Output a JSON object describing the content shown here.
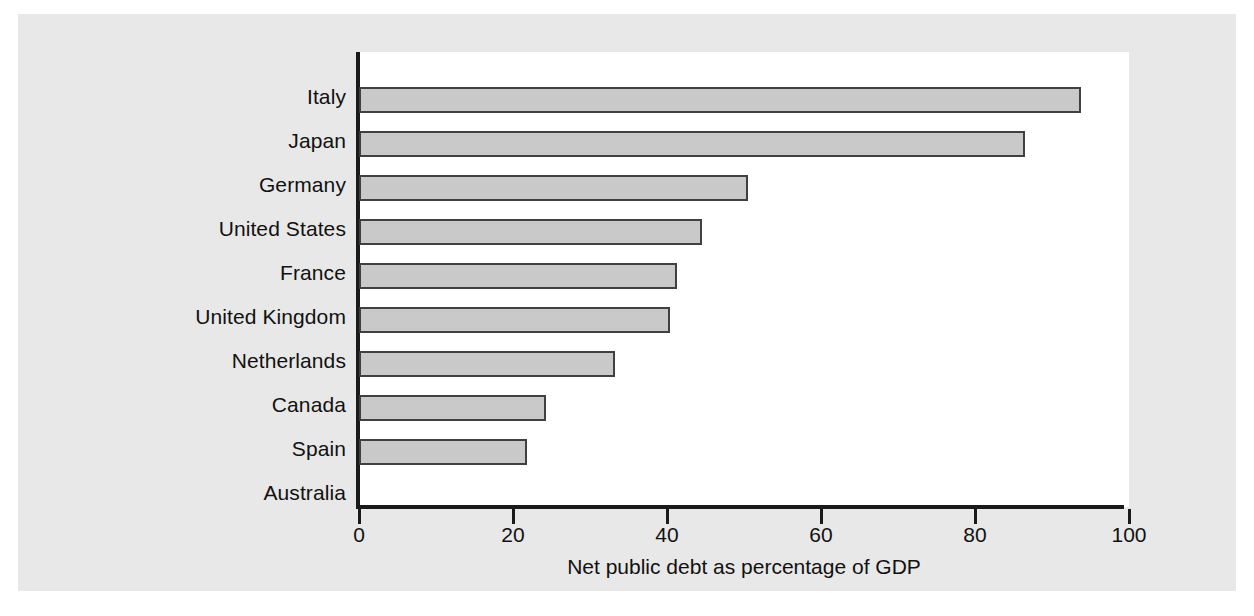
{
  "chart_data": {
    "type": "bar",
    "orientation": "horizontal",
    "title": "",
    "subtitle": "",
    "xlabel": "Net public debt as percentage of GDP",
    "ylabel": "",
    "xlim": [
      0,
      100
    ],
    "xticks": [
      0,
      20,
      40,
      60,
      80,
      100
    ],
    "xtick_labels": [
      "0",
      "20",
      "40",
      "60",
      "80",
      "100"
    ],
    "grid": false,
    "legend": null,
    "categories": [
      "Italy",
      "Japan",
      "Germany",
      "United States",
      "France",
      "United Kingdom",
      "Netherlands",
      "Canada",
      "Spain",
      "Australia"
    ],
    "values": [
      93.8,
      86.5,
      50.5,
      44.5,
      41.3,
      40.4,
      33.3,
      24.3,
      21.8,
      0
    ],
    "bar_fill_color": "#c9c9c9",
    "bar_edge_color": "#404040",
    "axis_color": "#1a1a1a",
    "plot_background": "#ffffff",
    "figure_background": "#e8e8e8"
  },
  "axis": {
    "x_title": "Net public debt as percentage of GDP"
  }
}
